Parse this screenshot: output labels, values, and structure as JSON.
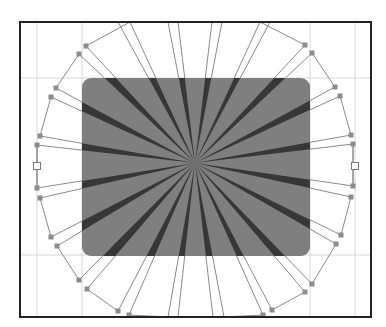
{
  "canvas": {
    "width": 386,
    "height": 327,
    "background": "#ffffff"
  },
  "frame": {
    "x": 20,
    "y": 22,
    "width": 351,
    "height": 295,
    "stroke": "#222222",
    "stroke_width": 2
  },
  "guides": {
    "color": "#d8d8d8",
    "vertical": [
      37,
      82,
      310,
      355
    ],
    "horizontal": [
      78,
      255
    ]
  },
  "shape": {
    "name": "rounded-rectangle",
    "x": 82,
    "y": 78,
    "width": 228,
    "height": 178,
    "radius": 9,
    "fill": "#7f7f7f"
  },
  "starburst": {
    "center": [
      195,
      163
    ],
    "ray_color": "#2a2a2a",
    "outline_color": "#8a8a8a",
    "handle_color": "#8c8c8c",
    "ray_pairs": [
      [
        [
          130,
          22
        ],
        [
          118,
          22
        ]
      ],
      [
        [
          178,
          22
        ],
        [
          168,
          22
        ]
      ],
      [
        [
          222,
          22
        ],
        [
          212,
          22
        ]
      ],
      [
        [
          270,
          22
        ],
        [
          260,
          22
        ]
      ],
      [
        [
          305,
          45
        ],
        [
          312,
          53
        ]
      ],
      [
        [
          335,
          87
        ],
        [
          340,
          96
        ]
      ],
      [
        [
          351,
          135
        ],
        [
          353,
          144
        ]
      ],
      [
        [
          353,
          186
        ],
        [
          351,
          197
        ]
      ],
      [
        [
          341,
          235
        ],
        [
          336,
          244
        ]
      ],
      [
        [
          312,
          284
        ],
        [
          305,
          292
        ]
      ],
      [
        [
          272,
          310
        ],
        [
          263,
          315
        ]
      ],
      [
        [
          224,
          317
        ],
        [
          213,
          317
        ]
      ],
      [
        [
          178,
          317
        ],
        [
          168,
          317
        ]
      ],
      [
        [
          129,
          315
        ],
        [
          118,
          311
        ]
      ],
      [
        [
          87,
          289
        ],
        [
          79,
          280
        ]
      ],
      [
        [
          57,
          246
        ],
        [
          51,
          237
        ]
      ],
      [
        [
          40,
          198
        ],
        [
          37,
          188
        ]
      ],
      [
        [
          37,
          145
        ],
        [
          40,
          136
        ]
      ],
      [
        [
          51,
          97
        ],
        [
          56,
          88
        ]
      ],
      [
        [
          79,
          54
        ],
        [
          86,
          46
        ]
      ]
    ],
    "side_handles": [
      [
        37,
        166
      ],
      [
        355,
        166
      ]
    ]
  }
}
